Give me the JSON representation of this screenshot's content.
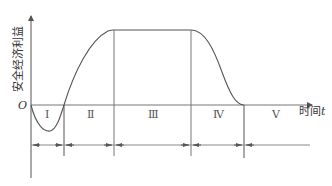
{
  "diagram": {
    "type": "phase-curve",
    "y_axis_label": "安全经济利益",
    "x_axis_label": "时间",
    "x_axis_symbol": "t",
    "origin_label": "O",
    "phases": [
      {
        "label": "Ⅰ",
        "description": "negative dip below zero"
      },
      {
        "label": "Ⅱ",
        "description": "rising"
      },
      {
        "label": "Ⅲ",
        "description": "plateau at maximum"
      },
      {
        "label": "Ⅳ",
        "description": "declining"
      },
      {
        "label": "Ⅴ",
        "description": "zero"
      }
    ],
    "colors": {
      "line": "#555555",
      "text": "#333333",
      "background": "#ffffff"
    }
  }
}
